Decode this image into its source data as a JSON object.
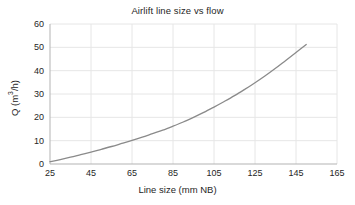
{
  "chart_data": {
    "type": "line",
    "title": "Airlift line size vs flow",
    "xlabel": "Line size (mm NB)",
    "ylabel_prefix": "Q (m",
    "ylabel_sup": "3",
    "ylabel_suffix": "/h)",
    "ylabel": "Q (m3/h)",
    "xlim": [
      25,
      165
    ],
    "ylim": [
      0,
      60
    ],
    "xticks": [
      25,
      45,
      65,
      85,
      105,
      125,
      145,
      165
    ],
    "yticks": [
      0,
      10,
      20,
      30,
      40,
      50,
      60
    ],
    "grid": true,
    "legend": "none",
    "line_color": "#8a8a8a",
    "grid_color": "#e6e6e6",
    "axis_color": "#b3b3b3",
    "series": [
      {
        "name": "Flow",
        "x": [
          25,
          30,
          35,
          40,
          45,
          50,
          55,
          60,
          65,
          70,
          75,
          80,
          85,
          90,
          95,
          100,
          105,
          110,
          115,
          120,
          125,
          130,
          135,
          140,
          145,
          150
        ],
        "values": [
          1.0,
          1.9,
          2.9,
          4.0,
          5.1,
          6.3,
          7.5,
          8.8,
          10.1,
          11.5,
          13.0,
          14.5,
          16.2,
          18.0,
          20.0,
          22.1,
          24.4,
          26.8,
          29.3,
          32.0,
          34.8,
          37.8,
          41.0,
          44.4,
          47.8,
          51.2
        ]
      }
    ]
  }
}
